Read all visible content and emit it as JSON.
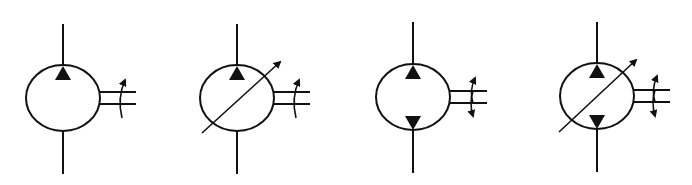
{
  "diagram": {
    "type": "hydraulic-symbols",
    "colors": {
      "stroke": "#111111",
      "background": "#ffffff"
    },
    "symbols": [
      {
        "name": "fixed-displacement-pump-unidirectional",
        "cx": 63,
        "variable": false,
        "bottom_triangle": false,
        "shaft_rotation": "single"
      },
      {
        "name": "variable-displacement-pump-unidirectional",
        "cx": 237,
        "variable": true,
        "bottom_triangle": false,
        "shaft_rotation": "single"
      },
      {
        "name": "fixed-displacement-pump-bidirectional",
        "cx": 413,
        "variable": false,
        "bottom_triangle": true,
        "shaft_rotation": "double"
      },
      {
        "name": "variable-displacement-pump-bidirectional",
        "cx": 597,
        "variable": true,
        "bottom_triangle": true,
        "shaft_rotation": "double"
      }
    ]
  }
}
